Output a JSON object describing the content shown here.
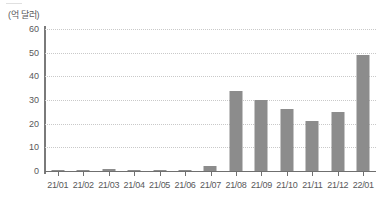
{
  "unit_label": "(억 달러)",
  "colors": {
    "bar": "#8c8c8c",
    "axis": "#7a7a7a",
    "grid": "#c9c9c9",
    "text": "#58585a",
    "background": "#ffffff"
  },
  "chart_data": {
    "type": "bar",
    "title": "",
    "xlabel": "",
    "ylabel": "(억 달러)",
    "ylim": [
      0,
      60
    ],
    "yticks": [
      0,
      10,
      20,
      30,
      40,
      50,
      60
    ],
    "grid": true,
    "legend": "none",
    "categories": [
      "21/01",
      "21/02",
      "21/03",
      "21/04",
      "21/05",
      "21/06",
      "21/07",
      "21/08",
      "21/09",
      "21/10",
      "21/11",
      "21/12",
      "22/01"
    ],
    "values": [
      0.2,
      0.4,
      0.8,
      0.3,
      0.6,
      0.5,
      2.0,
      34,
      30,
      26,
      21,
      25,
      49
    ]
  }
}
